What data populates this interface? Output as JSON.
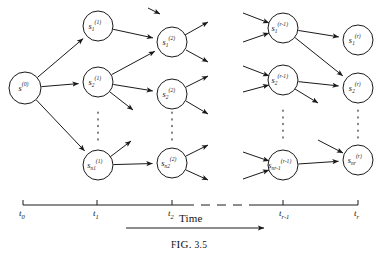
{
  "figure": {
    "caption_prefix": "F",
    "caption_small": "IG.",
    "caption_number": "3.5",
    "time_label": "Time",
    "stroke_color": "#1a1a1a",
    "background": "#ffffff"
  },
  "axis": {
    "y": 205,
    "x_start": 23,
    "x_end": 358,
    "dash_from": 185,
    "dash_to": 255,
    "ticks": [
      {
        "name": "t0",
        "x": 23,
        "base": "t",
        "sub": "0"
      },
      {
        "name": "t1",
        "x": 97,
        "base": "t",
        "sub": "1"
      },
      {
        "name": "t2",
        "x": 172,
        "base": "t",
        "sub": "2"
      },
      {
        "name": "tr-1",
        "x": 283,
        "base": "t",
        "sub": "r-1"
      },
      {
        "name": "tr",
        "x": 358,
        "base": "t",
        "sub": "r"
      }
    ]
  },
  "time_arrow": {
    "x1": 126,
    "x2": 264,
    "y": 228
  },
  "nodes": [
    {
      "id": "s0",
      "cx": 25,
      "cy": 88,
      "r": 16,
      "base": "s",
      "sub": "",
      "sup": "(0)"
    },
    {
      "id": "s1_1",
      "cx": 98,
      "cy": 26,
      "r": 15,
      "base": "s",
      "sub": "1",
      "sup": "(1)"
    },
    {
      "id": "s2_1",
      "cx": 98,
      "cy": 82,
      "r": 15,
      "base": "s",
      "sub": "2",
      "sup": "(1)"
    },
    {
      "id": "sn1_1",
      "cx": 98,
      "cy": 165,
      "r": 15,
      "base": "s",
      "sub": "n1",
      "sup": "(1)"
    },
    {
      "id": "s1_2",
      "cx": 172,
      "cy": 42,
      "r": 15,
      "base": "s",
      "sub": "1",
      "sup": "(2)"
    },
    {
      "id": "s2_2",
      "cx": 172,
      "cy": 94,
      "r": 15,
      "base": "s",
      "sub": "2",
      "sup": "(2)"
    },
    {
      "id": "sn2_2",
      "cx": 172,
      "cy": 163,
      "r": 15,
      "base": "s",
      "sub": "n2",
      "sup": "(2)"
    },
    {
      "id": "s1_r1",
      "cx": 283,
      "cy": 28,
      "r": 15,
      "base": "s",
      "sub": "1",
      "sup": "(r-1)"
    },
    {
      "id": "s2_r1",
      "cx": 283,
      "cy": 80,
      "r": 15,
      "base": "s",
      "sub": "2",
      "sup": "(r-1)"
    },
    {
      "id": "snr1_r1",
      "cx": 283,
      "cy": 165,
      "r": 15,
      "base": "s",
      "sub": "nr-1",
      "sup": "(r-1)"
    },
    {
      "id": "s1_r",
      "cx": 358,
      "cy": 40,
      "r": 15,
      "base": "s",
      "sub": "1",
      "sup": "(r)"
    },
    {
      "id": "s2_r",
      "cx": 358,
      "cy": 88,
      "r": 15,
      "base": "s",
      "sub": "2",
      "sup": "(r)"
    },
    {
      "id": "snr_r",
      "cx": 358,
      "cy": 160,
      "r": 15,
      "base": "s",
      "sub": "nr",
      "sup": "(r)"
    }
  ],
  "edges": [
    {
      "from": "s0",
      "to": "s1_1"
    },
    {
      "from": "s0",
      "to": "s2_1"
    },
    {
      "from": "s0",
      "to": "sn1_1"
    },
    {
      "from": "s1_1",
      "to": "s1_2"
    },
    {
      "from": "s2_1",
      "to": "s1_2"
    },
    {
      "from": "s2_1",
      "to": "s2_2"
    },
    {
      "from": "sn1_1",
      "to": "sn2_2"
    },
    {
      "from": "s1_r1",
      "to": "s1_r"
    },
    {
      "from": "s1_r1",
      "to": "s2_r"
    },
    {
      "from": "s2_r1",
      "to": "s2_r"
    },
    {
      "from": "snr1_r1",
      "to": "snr_r"
    }
  ],
  "stub_edges_out": [
    {
      "name": "stub-s2-1-down",
      "x1": 110,
      "y1": 92,
      "x2": 133,
      "y2": 110
    },
    {
      "name": "stub-sn1-1-up",
      "x1": 110,
      "y1": 157,
      "x2": 131,
      "y2": 141
    },
    {
      "name": "stub-s1-2-up",
      "x1": 185,
      "y1": 35,
      "x2": 208,
      "y2": 22
    },
    {
      "name": "stub-s1-2-down",
      "x1": 186,
      "y1": 50,
      "x2": 208,
      "y2": 62
    },
    {
      "name": "stub-s2-2-up",
      "x1": 186,
      "y1": 87,
      "x2": 208,
      "y2": 76
    },
    {
      "name": "stub-s2-2-down",
      "x1": 186,
      "y1": 101,
      "x2": 208,
      "y2": 114
    },
    {
      "name": "stub-sn2-2-up",
      "x1": 186,
      "y1": 156,
      "x2": 208,
      "y2": 145
    },
    {
      "name": "stub-sn2-2-down",
      "x1": 186,
      "y1": 170,
      "x2": 208,
      "y2": 180
    },
    {
      "name": "stub-s2-r1-down",
      "x1": 295,
      "y1": 89,
      "x2": 318,
      "y2": 103
    }
  ],
  "stub_edges_in": [
    {
      "name": "in-s1-r1-upper",
      "x1": 243,
      "y1": 13,
      "x2": 269,
      "y2": 23
    },
    {
      "name": "in-s1-r1-lower",
      "x1": 243,
      "y1": 42,
      "x2": 269,
      "y2": 33
    },
    {
      "name": "in-s2-r1-upper",
      "x1": 243,
      "y1": 66,
      "x2": 269,
      "y2": 76
    },
    {
      "name": "in-s2-r1-lower",
      "x1": 243,
      "y1": 92,
      "x2": 269,
      "y2": 85
    },
    {
      "name": "in-snr1-upper",
      "x1": 243,
      "y1": 152,
      "x2": 269,
      "y2": 161
    },
    {
      "name": "in-snr1-lower",
      "x1": 243,
      "y1": 179,
      "x2": 269,
      "y2": 170
    },
    {
      "name": "in-s1-r-upper",
      "x1": 148,
      "y1": 8,
      "x2": 160,
      "y2": 14
    },
    {
      "name": "in-snr-r-upper",
      "x1": 318,
      "y1": 140,
      "x2": 343,
      "y2": 153
    }
  ],
  "ellipses": [
    {
      "name": "ellipsis-col1",
      "x": 98,
      "y_top": 112,
      "y_bottom": 142
    },
    {
      "name": "ellipsis-col2",
      "x": 172,
      "y_top": 112,
      "y_bottom": 142
    },
    {
      "name": "ellipsis-col3",
      "x": 283,
      "y_top": 110,
      "y_bottom": 143
    },
    {
      "name": "ellipsis-col4",
      "x": 358,
      "y_top": 110,
      "y_bottom": 143
    }
  ]
}
